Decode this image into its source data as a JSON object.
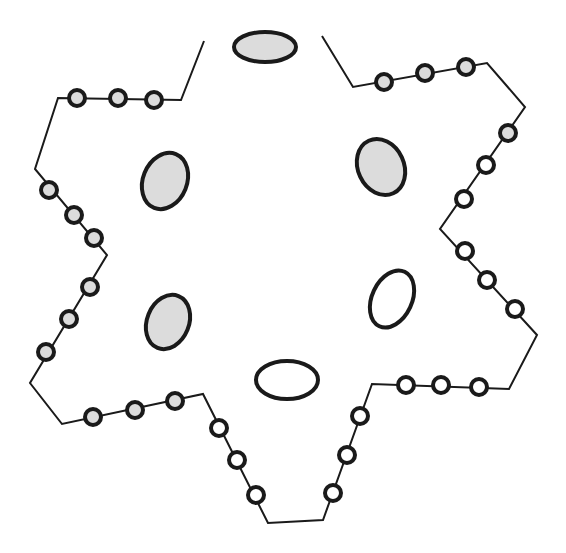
{
  "diagram": {
    "width": 566,
    "height": 553,
    "background": "#ffffff",
    "stroke_color": "#1a1a1a",
    "fill_gray": "#dcdcdc",
    "fill_white": "#ffffff",
    "outline_path": [
      [
        204,
        41
      ],
      [
        181,
        100
      ],
      [
        58,
        98
      ],
      [
        35,
        169
      ],
      [
        107,
        255
      ],
      [
        30,
        383
      ],
      [
        62,
        424
      ],
      [
        203,
        394
      ],
      [
        268,
        523
      ],
      [
        323,
        520
      ],
      [
        372,
        384
      ],
      [
        509,
        389
      ],
      [
        537,
        335
      ],
      [
        440,
        229
      ],
      [
        525,
        107
      ],
      [
        487,
        63
      ],
      [
        353,
        87
      ],
      [
        322,
        36
      ]
    ],
    "beads": [
      {
        "x": 77,
        "y": 98,
        "fill": "gray"
      },
      {
        "x": 118,
        "y": 98,
        "fill": "gray"
      },
      {
        "x": 154,
        "y": 100,
        "fill": "gray"
      },
      {
        "x": 49,
        "y": 190,
        "fill": "gray"
      },
      {
        "x": 74,
        "y": 215,
        "fill": "gray"
      },
      {
        "x": 94,
        "y": 238,
        "fill": "gray"
      },
      {
        "x": 90,
        "y": 287,
        "fill": "gray"
      },
      {
        "x": 69,
        "y": 319,
        "fill": "gray"
      },
      {
        "x": 46,
        "y": 352,
        "fill": "gray"
      },
      {
        "x": 93,
        "y": 417,
        "fill": "gray"
      },
      {
        "x": 135,
        "y": 410,
        "fill": "gray"
      },
      {
        "x": 175,
        "y": 401,
        "fill": "gray"
      },
      {
        "x": 219,
        "y": 428,
        "fill": "white"
      },
      {
        "x": 237,
        "y": 460,
        "fill": "white"
      },
      {
        "x": 256,
        "y": 495,
        "fill": "white"
      },
      {
        "x": 333,
        "y": 493,
        "fill": "white"
      },
      {
        "x": 347,
        "y": 455,
        "fill": "white"
      },
      {
        "x": 360,
        "y": 416,
        "fill": "white"
      },
      {
        "x": 406,
        "y": 385,
        "fill": "white"
      },
      {
        "x": 441,
        "y": 385,
        "fill": "white"
      },
      {
        "x": 479,
        "y": 387,
        "fill": "white"
      },
      {
        "x": 515,
        "y": 309,
        "fill": "white"
      },
      {
        "x": 487,
        "y": 280,
        "fill": "white"
      },
      {
        "x": 465,
        "y": 251,
        "fill": "white"
      },
      {
        "x": 464,
        "y": 199,
        "fill": "white"
      },
      {
        "x": 486,
        "y": 165,
        "fill": "white"
      },
      {
        "x": 508,
        "y": 133,
        "fill": "gray"
      },
      {
        "x": 384,
        "y": 82,
        "fill": "gray"
      },
      {
        "x": 425,
        "y": 73,
        "fill": "gray"
      },
      {
        "x": 466,
        "y": 67,
        "fill": "gray"
      }
    ],
    "bead_radius": 8,
    "ellipses": [
      {
        "name": "top",
        "cx": 265,
        "cy": 47,
        "rx": 31,
        "ry": 15,
        "rotate": 0,
        "fill": "gray"
      },
      {
        "name": "upper-left",
        "cx": 165,
        "cy": 181,
        "rx": 22,
        "ry": 29,
        "rotate": 22,
        "fill": "gray"
      },
      {
        "name": "upper-right",
        "cx": 381,
        "cy": 167,
        "rx": 23,
        "ry": 29,
        "rotate": -25,
        "fill": "gray"
      },
      {
        "name": "lower-left",
        "cx": 168,
        "cy": 322,
        "rx": 21,
        "ry": 28,
        "rotate": 22,
        "fill": "gray"
      },
      {
        "name": "right-middle",
        "cx": 392,
        "cy": 299,
        "rx": 20,
        "ry": 30,
        "rotate": 25,
        "fill": "white"
      },
      {
        "name": "bottom",
        "cx": 287,
        "cy": 380,
        "rx": 31,
        "ry": 19,
        "rotate": 0,
        "fill": "white"
      }
    ]
  }
}
